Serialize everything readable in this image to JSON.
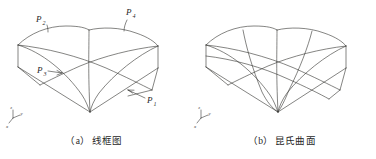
{
  "document": {
    "kind": "technical-illustration",
    "subject": "Coons surface construction figure pair"
  },
  "figures": [
    {
      "id": "wireframe",
      "caption_index": "（a）",
      "caption_text": "线框图",
      "caption_full": "（a）线框图",
      "point_labels": [
        {
          "id": "p2",
          "base": "P",
          "sub": "2",
          "x": 36,
          "y": 17
        },
        {
          "id": "p4",
          "base": "P",
          "sub": "4",
          "x": 126,
          "y": 13
        },
        {
          "id": "p3",
          "base": "P",
          "sub": "3",
          "x": 37,
          "y": 73
        },
        {
          "id": "p1",
          "base": "P",
          "sub": "1",
          "x": 147,
          "y": 101
        }
      ],
      "axis_marker": {
        "x": "x",
        "y": "y",
        "z": "z"
      }
    },
    {
      "id": "coons",
      "caption_index": "（b）",
      "caption_text": "昆氏曲面",
      "caption_full": "（b）昆氏曲面",
      "point_labels": [],
      "axis_marker": {
        "x": "x",
        "y": "y",
        "z": "z"
      }
    }
  ],
  "style": {
    "line_color": "#33322f",
    "background": "#ffffff",
    "text_color": "#1f1f1f",
    "line_width": 0.6
  }
}
